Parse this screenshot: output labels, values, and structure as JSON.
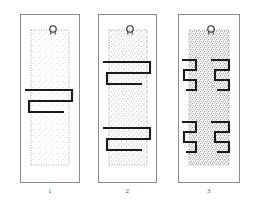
{
  "figure": {
    "type": "technical-line-drawing",
    "background_color": "#ffffff",
    "frame_color": "#8c8c8c",
    "trace_color": "#1a1a1a",
    "stipple_color": "#9a9a9a",
    "panel_count": 3
  },
  "panels": [
    {
      "caption": "1",
      "frame": {
        "x": 20,
        "y": 14,
        "w": 60,
        "h": 169
      },
      "substrate": {
        "label": "stippled-substrate",
        "x": 31,
        "y": 30,
        "w": 38,
        "h": 135,
        "stipple_density": "light",
        "outline_style": "dotted"
      },
      "loop": {
        "label": "suspension-loop",
        "cx": 53,
        "cy": 29,
        "r": 3.2
      },
      "traces": [
        {
          "name": "meander-trace-center",
          "turns": 1,
          "points": "25,90 72,90 72,101 29,101 29,112 64,112"
        }
      ]
    },
    {
      "caption": "2",
      "frame": {
        "x": 98,
        "y": 14,
        "w": 59,
        "h": 169
      },
      "substrate": {
        "label": "stippled-substrate",
        "x": 109,
        "y": 30,
        "w": 38,
        "h": 135,
        "stipple_density": "medium",
        "outline_style": "dotted"
      },
      "loop": {
        "label": "suspension-loop",
        "cx": 130,
        "cy": 29,
        "r": 3.2
      },
      "traces": [
        {
          "name": "meander-trace-upper",
          "turns": 1,
          "points": "103,62 150,62 150,73 107,73 107,84 142,84"
        },
        {
          "name": "meander-trace-lower",
          "turns": 1,
          "points": "103,128 150,128 150,139 107,139 107,150 142,150"
        }
      ]
    },
    {
      "caption": "3",
      "frame": {
        "x": 178,
        "y": 14,
        "w": 62,
        "h": 169
      },
      "substrate": {
        "label": "stippled-substrate",
        "x": 189,
        "y": 30,
        "w": 40,
        "h": 135,
        "stipple_density": "heavy",
        "outline_style": "dotted"
      },
      "loop": {
        "label": "suspension-loop",
        "cx": 211,
        "cy": 29,
        "r": 3.2
      },
      "traces": [
        {
          "name": "meander-trace-upper-left",
          "turns": 1,
          "points": "182,60 196,60 196,70 184,70 184,80 196,80 196,90 186,90"
        },
        {
          "name": "meander-trace-upper-right",
          "turns": 1,
          "points": "211,60 229,60 229,70 215,70 215,80 229,80 229,90 217,90"
        },
        {
          "name": "meander-trace-lower-left",
          "turns": 1,
          "points": "182,122 196,122 196,132 184,132 184,142 196,142 196,152 186,152"
        },
        {
          "name": "meander-trace-lower-right",
          "turns": 1,
          "points": "211,122 229,122 229,132 215,132 215,142 229,142 229,152 217,152"
        }
      ]
    }
  ]
}
